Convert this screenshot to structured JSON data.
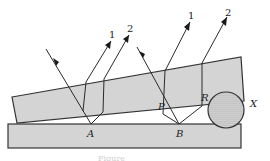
{
  "figure": {
    "labels": {
      "ray1_left": "1",
      "ray2_left": "2",
      "ray1_right": "1",
      "ray2_right": "2",
      "point_a": "A",
      "point_b": "B",
      "point_p": "P",
      "point_r": "R",
      "object_x": "X"
    },
    "caption": "Figure",
    "colors": {
      "plate_fill": "#d4d4d4",
      "outline": "#333333",
      "background": "#ffffff"
    }
  }
}
